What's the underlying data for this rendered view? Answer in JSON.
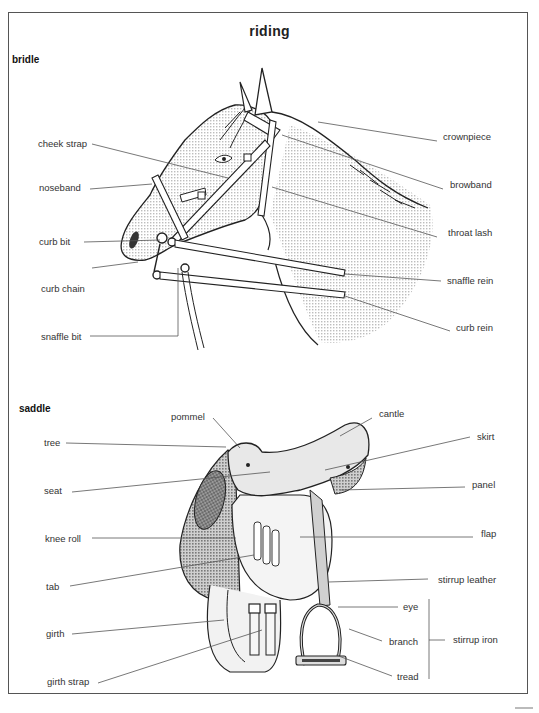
{
  "page": {
    "title": "riding",
    "sections": {
      "bridle": "bridle",
      "saddle": "saddle"
    }
  },
  "bridle": {
    "labels": {
      "cheek_strap": "cheek strap",
      "noseband": "noseband",
      "curb_bit": "curb bit",
      "curb_chain": "curb chain",
      "snaffle_bit": "snaffle bit",
      "crownpiece": "crownpiece",
      "browband": "browband",
      "throat_lash": "throat lash",
      "snaffle_rein": "snaffle rein",
      "curb_rein": "curb rein"
    }
  },
  "saddle": {
    "labels": {
      "pommel": "pommel",
      "cantle": "cantle",
      "tree": "tree",
      "skirt": "skirt",
      "seat": "seat",
      "panel": "panel",
      "knee_roll": "knee roll",
      "flap": "flap",
      "tab": "tab",
      "stirrup_leather": "stirrup leather",
      "girth": "girth",
      "eye": "eye",
      "branch": "branch",
      "stirrup_iron": "stirrup iron",
      "girth_strap": "girth strap",
      "tread": "tread"
    }
  },
  "colors": {
    "shade_light": "#e4e4e4",
    "shade_mid": "#b8b8b8",
    "shade_dark": "#8c8c8c",
    "ink": "#222222",
    "leader": "#555555"
  }
}
